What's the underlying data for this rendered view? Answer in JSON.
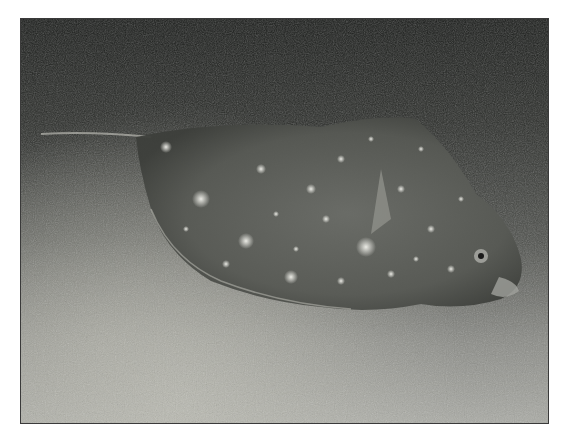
{
  "image": {
    "subject": "Flatfish (flounder) resting on sandy seabed",
    "style": "grayscale underwater photograph",
    "colors": {
      "background": "#ffffff",
      "frame": "#3a3a3a",
      "seabed_dark": "#1a1c1a",
      "seabed_light": "#a9aaa4",
      "fish_body": "#5a5c58",
      "fish_spots": "#e6e6e0"
    }
  },
  "caption_fragment": {
    "text": "",
    "note_visible": "faint cut-off text line, illegible"
  }
}
